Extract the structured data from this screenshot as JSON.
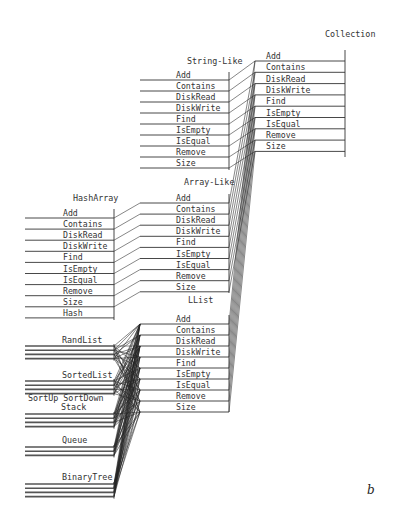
{
  "diagram": {
    "type": "class-hierarchy-method-inheritance",
    "figure_label": "b",
    "nodes": {
      "collection": {
        "title": "Collection",
        "methods": [
          "Add",
          "Contains",
          "DiskRead",
          "DiskWrite",
          "Find",
          "IsEmpty",
          "IsEqual",
          "Remove",
          "Size"
        ]
      },
      "string_like": {
        "title": "String-Like",
        "methods": [
          "Add",
          "Contains",
          "DiskRead",
          "DiskWrite",
          "Find",
          "IsEmpty",
          "IsEqual",
          "Remove",
          "Size"
        ]
      },
      "array_like": {
        "title": "Array-Like",
        "methods": [
          "Add",
          "Contains",
          "DiskRead",
          "DiskWrite",
          "Find",
          "IsEmpty",
          "IsEqual",
          "Remove",
          "Size"
        ]
      },
      "hash_array": {
        "title": "HashArray",
        "methods": [
          "Add",
          "Contains",
          "DiskRead",
          "DiskWrite",
          "Find",
          "IsEmpty",
          "IsEqual",
          "Remove",
          "Size",
          "Hash"
        ]
      },
      "llist": {
        "title": "LList",
        "methods": [
          "Add",
          "Contains",
          "DiskRead",
          "DiskWrite",
          "Find",
          "IsEmpty",
          "IsEqual",
          "Remove",
          "Size"
        ]
      },
      "rand_list": {
        "title": "RandList"
      },
      "sorted_list": {
        "title": "SortedList"
      },
      "sort_up_down": {
        "title": "SortUp SortDown"
      },
      "stack": {
        "title": "Stack"
      },
      "queue": {
        "title": "Queue"
      },
      "binary_tree": {
        "title": "BinaryTree"
      }
    }
  }
}
